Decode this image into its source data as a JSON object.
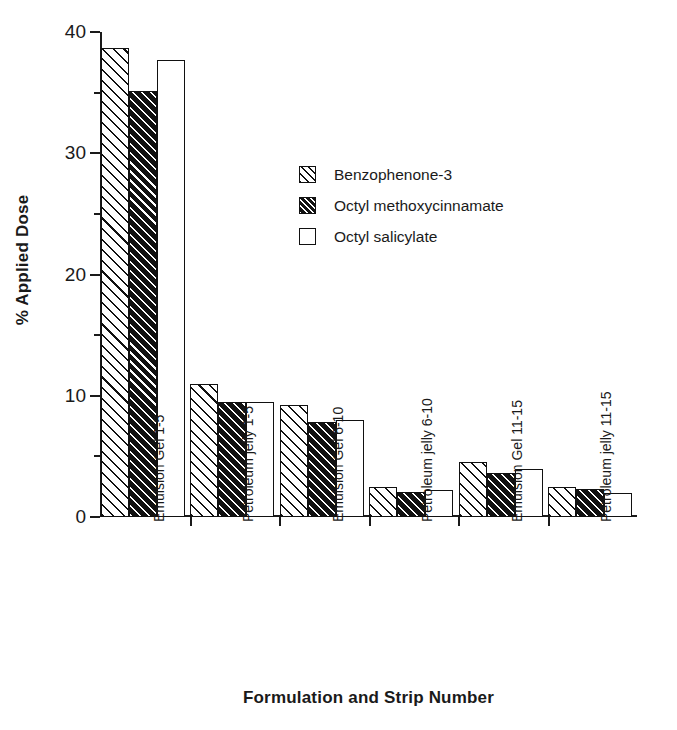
{
  "chart_data": {
    "type": "bar",
    "title": "",
    "xlabel": "Formulation and Strip Number",
    "ylabel": "% Applied Dose",
    "ylim": [
      0,
      40
    ],
    "yticks": [
      0,
      10,
      20,
      30,
      40
    ],
    "ytick_labels": [
      "0",
      "10",
      "20",
      "30",
      "40"
    ],
    "yminorticks": [
      5,
      15,
      25,
      35
    ],
    "grid": false,
    "legend_position": "upper center",
    "categories": [
      "Emulsion Gel 1-5",
      "Petroleum jelly 1-5",
      "Emulsion Gel 6-10",
      "Petroleum jelly 6-10",
      "Emulsion Gel 11-15",
      "Petroleum jelly 11-15"
    ],
    "series": [
      {
        "name": "Benzophenone-3",
        "pattern": "diagonal-hatch-on-white",
        "values": [
          38.7,
          11.0,
          9.2,
          2.5,
          4.5,
          2.5
        ]
      },
      {
        "name": "Octyl methoxycinnamate",
        "pattern": "diagonal-hatch-on-black",
        "values": [
          35.1,
          9.5,
          7.8,
          2.1,
          3.6,
          2.3
        ]
      },
      {
        "name": "Octyl salicylate",
        "pattern": "solid-white",
        "values": [
          37.7,
          9.5,
          8.0,
          2.2,
          4.0,
          2.0
        ]
      }
    ]
  },
  "colors": {
    "foreground": "#1a1a1a",
    "series_fill_dark": "#121212",
    "background": "#ffffff"
  }
}
